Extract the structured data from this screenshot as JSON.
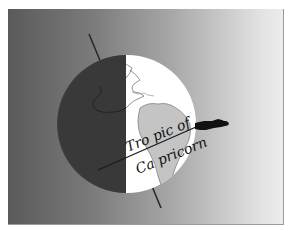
{
  "illustration": {
    "subject": "globe-with-tropic-of-capricorn",
    "label_line1": "Tro pic of",
    "label_line2": "Ca pricorn",
    "colors": {
      "background_dark": "#5a5a5a",
      "background_light": "#ececec",
      "globe_light": "#ffffff",
      "globe_shadow": "#3c3c3c",
      "land_light": "#b8b8b8",
      "axis": "#2a2a2a",
      "silhouette": "#111111"
    }
  }
}
